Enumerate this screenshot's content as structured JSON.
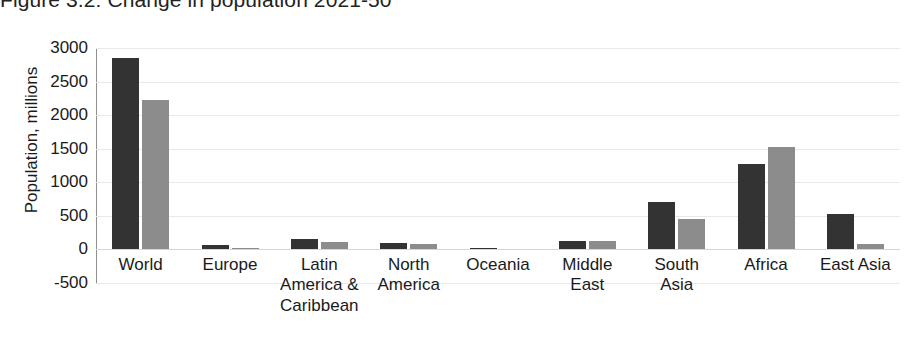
{
  "figure": {
    "title": "Figure 3.2: Change in population 2021-50"
  },
  "chart_data": {
    "type": "bar",
    "title": "Figure 3.2: Change in population 2021-50",
    "xlabel": "",
    "ylabel": "Population, millions",
    "ylim": [
      -500,
      3000
    ],
    "yticks": [
      "3000",
      "2500",
      "2000",
      "1500",
      "1000",
      "500",
      "0",
      "-500"
    ],
    "ytick_values": [
      3000,
      2500,
      2000,
      1500,
      1000,
      500,
      0,
      -500
    ],
    "grid": true,
    "legend": "none",
    "categories": [
      "World",
      "Europe",
      "Latin\nAmerica &\nCaribbean",
      "North\nAmerica",
      "Oceania",
      "Middle\nEast",
      "South\nAsia",
      "Africa",
      "East Asia"
    ],
    "series": [
      {
        "name": "series-1",
        "color": "#333333",
        "values": [
          2850,
          60,
          150,
          95,
          15,
          120,
          710,
          1270,
          530
        ]
      },
      {
        "name": "series-2",
        "color": "#8c8c8c",
        "values": [
          2220,
          20,
          110,
          85,
          12,
          120,
          450,
          1530,
          80
        ]
      }
    ]
  }
}
